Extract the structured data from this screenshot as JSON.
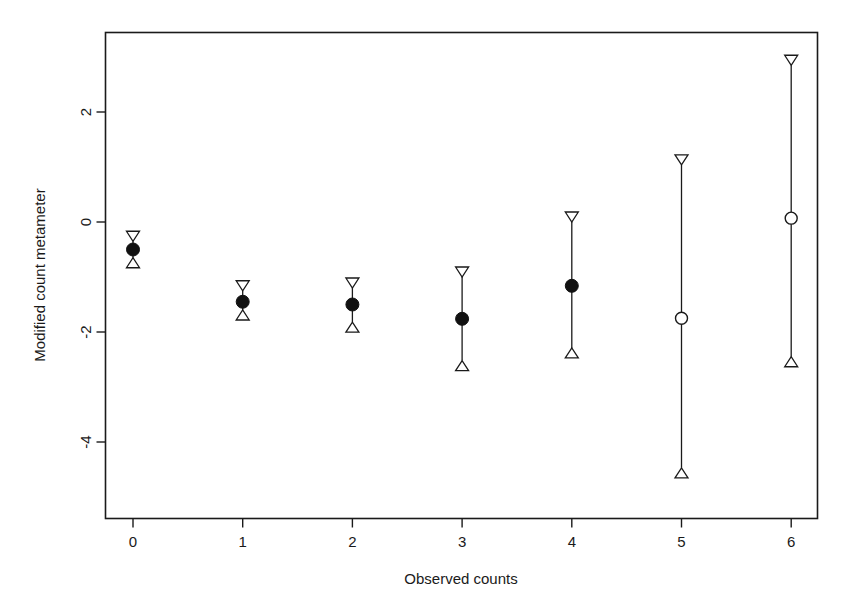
{
  "chart_data": {
    "type": "scatter",
    "title": "",
    "xlabel": "Observed counts",
    "ylabel": "Modified count metameter",
    "grid": false,
    "legend": "none",
    "x_ticks": [
      "0",
      "1",
      "2",
      "3",
      "4",
      "5",
      "6"
    ],
    "x_tick_values": [
      0,
      1,
      2,
      3,
      4,
      5,
      6
    ],
    "y_ticks": [
      "2",
      "0",
      "-2",
      "-4"
    ],
    "y_tick_values": [
      2,
      0,
      -2,
      -4
    ],
    "xlim": [
      -0.26,
      6.26
    ],
    "ylim": [
      -5.0,
      3.3
    ],
    "categories": [
      0,
      1,
      2,
      3,
      4,
      5,
      6
    ],
    "series": [
      {
        "name": "Modified count metameter estimate",
        "marker": "circle",
        "values": [
          -0.5,
          -1.45,
          -1.5,
          -1.76,
          -1.16,
          -1.75,
          0.07
        ]
      },
      {
        "name": "Upper confidence limit",
        "marker": "down-triangle",
        "values": [
          -0.35,
          -1.25,
          -1.2,
          -1.0,
          0.0,
          1.04,
          2.85
        ]
      },
      {
        "name": "Lower confidence limit",
        "marker": "up-triangle",
        "values": [
          -0.65,
          -1.6,
          -1.82,
          -2.52,
          -2.29,
          -4.47,
          -2.45
        ]
      }
    ],
    "point_styles": [
      "filled",
      "filled",
      "filled",
      "filled",
      "filled",
      "open",
      "open"
    ],
    "colors": {
      "foreground": "#1a1a1a",
      "marker_fill": "#111111",
      "open_marker_fill": "#ffffff",
      "background": "#ffffff"
    }
  }
}
